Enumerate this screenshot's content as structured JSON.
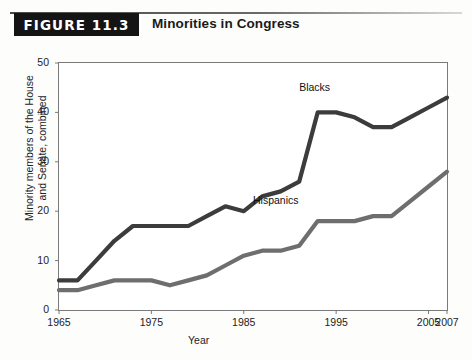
{
  "header": {
    "figure_tag": "FIGURE 11.3",
    "title": "Minorities in Congress"
  },
  "chart_data": {
    "type": "line",
    "title": "Minorities in Congress",
    "xlabel": "Year",
    "ylabel": "Minority members of the House and Senate, combined",
    "ylabel_line1": "Minority members of the House",
    "ylabel_line2": "and Senate, combined",
    "xlim": [
      1965,
      2007
    ],
    "ylim": [
      0,
      50
    ],
    "grid": false,
    "legend_position": "inline-annotation",
    "yticks": [
      "0",
      "10",
      "20",
      "30",
      "40",
      "50"
    ],
    "ytick_values": [
      0,
      10,
      20,
      30,
      40,
      50
    ],
    "xticks": [
      "1965",
      "1975",
      "1985",
      "1995",
      "2005",
      "2007"
    ],
    "xtick_values": [
      1965,
      1975,
      1985,
      1995,
      2005,
      2007
    ],
    "series": [
      {
        "name": "Blacks",
        "color": "#3c3c3c",
        "label_x": 1991,
        "label_y": 45,
        "x": [
          1965,
          1967,
          1969,
          1971,
          1973,
          1975,
          1977,
          1979,
          1981,
          1983,
          1985,
          1987,
          1989,
          1991,
          1993,
          1995,
          1997,
          1999,
          2001,
          2003,
          2005,
          2007
        ],
        "y": [
          6,
          6,
          10,
          14,
          17,
          17,
          17,
          17,
          19,
          21,
          20,
          23,
          24,
          26,
          40,
          40,
          39,
          37,
          37,
          39,
          41,
          43
        ]
      },
      {
        "name": "Hispanics",
        "color": "#6e6e6e",
        "label_x": 1986,
        "label_y": 22,
        "x": [
          1965,
          1967,
          1969,
          1971,
          1973,
          1975,
          1977,
          1979,
          1981,
          1983,
          1985,
          1987,
          1989,
          1991,
          1993,
          1995,
          1997,
          1999,
          2001,
          2003,
          2005,
          2007
        ],
        "y": [
          4,
          4,
          5,
          6,
          6,
          6,
          5,
          6,
          7,
          9,
          11,
          12,
          12,
          13,
          18,
          18,
          18,
          19,
          19,
          22,
          25,
          28
        ]
      }
    ]
  }
}
